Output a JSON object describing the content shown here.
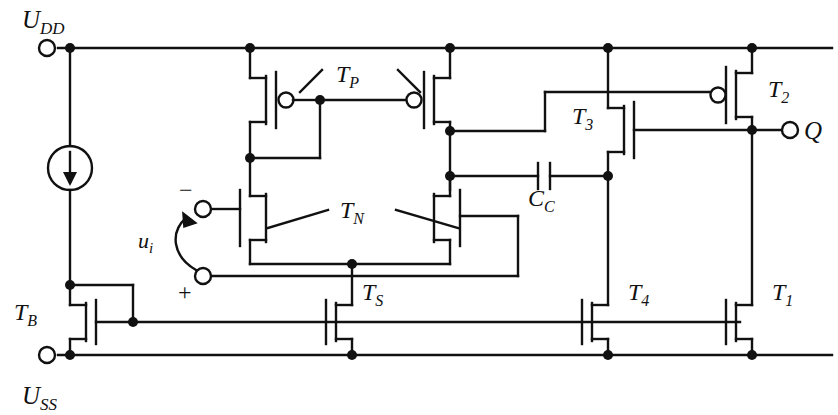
{
  "diagram": {
    "type": "circuit-schematic",
    "stroke_color": "#111111",
    "background_color": "#ffffff",
    "line_width": 2.4
  },
  "rails": {
    "top": {
      "label": "U",
      "sub": "DD",
      "y": 48
    },
    "bottom": {
      "label": "U",
      "sub": "SS",
      "y": 355
    },
    "bias": {
      "y": 322
    }
  },
  "terminals": [
    {
      "name": "udd-terminal",
      "label": "U",
      "sub": "DD",
      "x": 46,
      "y": 48
    },
    {
      "name": "uss-terminal",
      "label": "U",
      "sub": "SS",
      "x": 46,
      "y": 355
    },
    {
      "name": "input-minus-terminal",
      "label": "−",
      "x": 200,
      "y": 209
    },
    {
      "name": "input-plus-terminal",
      "label": "+",
      "x": 200,
      "y": 276
    },
    {
      "name": "output-terminal",
      "label": "Q",
      "x": 790,
      "y": 130
    }
  ],
  "labels": {
    "udd": "U",
    "udd_sub": "DD",
    "uss": "U",
    "uss_sub": "SS",
    "tp": "T",
    "tp_sub": "P",
    "tn": "T",
    "tn_sub": "N",
    "ts": "T",
    "ts_sub": "S",
    "tb": "T",
    "tb_sub": "B",
    "t1": "T",
    "t1_sub": "1",
    "t2": "T",
    "t2_sub": "2",
    "t3": "T",
    "t3_sub": "3",
    "t4": "T",
    "t4_sub": "4",
    "cc": "C",
    "cc_sub": "C",
    "ui": "u",
    "ui_sub": "i",
    "q": "Q",
    "minus": "−",
    "plus": "+"
  },
  "components": [
    {
      "name": "current-source",
      "type": "current-source",
      "x": 70,
      "y": 168,
      "direction": "down"
    },
    {
      "name": "transistor-tp-left",
      "type": "pmos",
      "label": "T_P",
      "x": 250,
      "y": 100
    },
    {
      "name": "transistor-tp-right",
      "type": "pmos",
      "label": "T_P",
      "x": 450,
      "y": 100
    },
    {
      "name": "transistor-tn-left",
      "type": "nmos",
      "label": "T_N",
      "x": 250,
      "y": 218
    },
    {
      "name": "transistor-tn-right",
      "type": "nmos",
      "label": "T_N",
      "x": 450,
      "y": 218
    },
    {
      "name": "transistor-ts",
      "type": "nmos",
      "label": "T_S",
      "x": 352,
      "y": 322
    },
    {
      "name": "transistor-tb",
      "type": "nmos",
      "label": "T_B",
      "x": 70,
      "y": 322
    },
    {
      "name": "transistor-t1",
      "type": "nmos",
      "label": "T_1",
      "x": 752,
      "y": 322
    },
    {
      "name": "transistor-t2",
      "type": "pmos",
      "label": "T_2",
      "x": 752,
      "y": 95
    },
    {
      "name": "transistor-t3",
      "type": "nmos",
      "label": "T_3",
      "x": 608,
      "y": 130
    },
    {
      "name": "transistor-t4",
      "type": "nmos",
      "label": "T_4",
      "x": 608,
      "y": 322
    },
    {
      "name": "capacitor-cc",
      "type": "capacitor",
      "label": "C_C",
      "x": 545,
      "y": 176
    }
  ],
  "nodes": [
    {
      "name": "node-udd-left",
      "x": 70,
      "y": 48
    },
    {
      "name": "node-udd-tp-left",
      "x": 250,
      "y": 48
    },
    {
      "name": "node-udd-tp-right",
      "x": 450,
      "y": 48
    },
    {
      "name": "node-udd-t3",
      "x": 608,
      "y": 48
    },
    {
      "name": "node-udd-t2",
      "x": 752,
      "y": 48
    },
    {
      "name": "node-tp-gate",
      "x": 320,
      "y": 100
    },
    {
      "name": "node-tp-left-drain",
      "x": 250,
      "y": 158
    },
    {
      "name": "node-tp-right-drain",
      "x": 450,
      "y": 131
    },
    {
      "name": "node-cc-left",
      "x": 450,
      "y": 176
    },
    {
      "name": "node-cc-right",
      "x": 608,
      "y": 176
    },
    {
      "name": "node-output",
      "x": 752,
      "y": 130
    },
    {
      "name": "node-tail",
      "x": 352,
      "y": 264
    },
    {
      "name": "node-bias-tb",
      "x": 70,
      "y": 285
    },
    {
      "name": "node-bias-line",
      "x": 133,
      "y": 322
    },
    {
      "name": "node-uss-tb",
      "x": 70,
      "y": 355
    },
    {
      "name": "node-uss-ts",
      "x": 352,
      "y": 355
    },
    {
      "name": "node-uss-t4",
      "x": 608,
      "y": 355
    },
    {
      "name": "node-uss-t1",
      "x": 752,
      "y": 355
    }
  ]
}
